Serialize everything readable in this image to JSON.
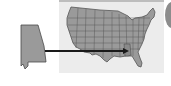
{
  "figure": {
    "highlighted_state": "Alabama",
    "colors": {
      "state_fill": "#9a9a9a",
      "state_border": "#4a4a4a",
      "panel_bg": "#ececec",
      "arrow": "#1a1a1a"
    }
  }
}
